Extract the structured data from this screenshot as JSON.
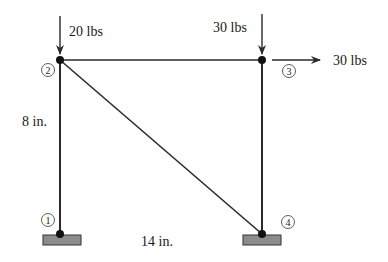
{
  "colors": {
    "member": "#2a2a2a",
    "node": "#111111",
    "support_fill": "#8c8c8c",
    "support_stroke": "#333333",
    "text": "#1a1a1a",
    "background": "#ffffff"
  },
  "nodes": [
    {
      "id": "1",
      "label": "1",
      "x": 60,
      "y": 234
    },
    {
      "id": "2",
      "label": "2",
      "x": 60,
      "y": 60
    },
    {
      "id": "3",
      "label": "3",
      "x": 262,
      "y": 60
    },
    {
      "id": "4",
      "label": "4",
      "x": 262,
      "y": 234
    }
  ],
  "members": [
    {
      "from": "1",
      "to": "2"
    },
    {
      "from": "2",
      "to": "3"
    },
    {
      "from": "3",
      "to": "4"
    },
    {
      "from": "2",
      "to": "4"
    }
  ],
  "supports": [
    {
      "node": "1",
      "label": "fixed-support"
    },
    {
      "node": "4",
      "label": "fixed-support"
    }
  ],
  "loads": [
    {
      "node": "2",
      "direction": "down",
      "label": "20 lbs"
    },
    {
      "node": "3",
      "direction": "down",
      "label": "30 lbs"
    },
    {
      "node": "3",
      "direction": "right",
      "label": "30 lbs"
    }
  ],
  "dimensions": {
    "height": "8 in.",
    "width": "14 in."
  }
}
